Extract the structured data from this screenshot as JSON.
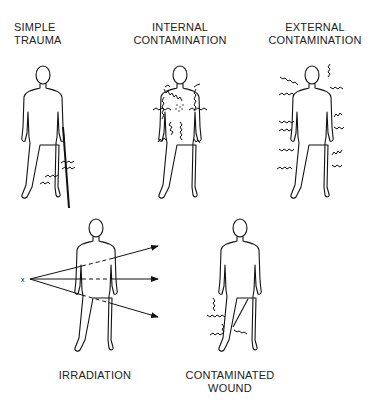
{
  "figure": {
    "panels": [
      {
        "id": "simple-trauma",
        "label_lines": [
          "SIMPLE",
          "TRAUMA"
        ]
      },
      {
        "id": "internal-contamination",
        "label_lines": [
          "INTERNAL",
          "CONTAMINATION"
        ]
      },
      {
        "id": "external-contamination",
        "label_lines": [
          "EXTERNAL",
          "CONTAMINATION"
        ]
      },
      {
        "id": "irradiation",
        "label_lines": [
          "IRRADIATION"
        ],
        "source_symbol": "x"
      },
      {
        "id": "contaminated-wound",
        "label_lines": [
          "CONTAMINATED",
          "WOUND"
        ]
      }
    ]
  }
}
